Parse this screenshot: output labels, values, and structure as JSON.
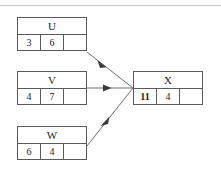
{
  "diagram": {
    "type": "dependency-flow",
    "top_rule_color": "#c9c9cc",
    "border_color": "#5a5a5e",
    "background_color": "#fefeff",
    "nodes": [
      {
        "id": "u",
        "name": "U",
        "cells": [
          "3",
          "6",
          ""
        ],
        "bold_cells": [
          false,
          false,
          false
        ]
      },
      {
        "id": "v",
        "name": "V",
        "cells": [
          "4",
          "7",
          ""
        ],
        "bold_cells": [
          false,
          false,
          false
        ]
      },
      {
        "id": "w",
        "name": "W",
        "cells": [
          "6",
          "4",
          ""
        ],
        "bold_cells": [
          false,
          false,
          false
        ]
      },
      {
        "id": "x",
        "name": "X",
        "cells": [
          "11",
          "4",
          ""
        ],
        "bold_cells": [
          true,
          false,
          false
        ]
      }
    ],
    "edges": [
      {
        "from": "U",
        "to": "X",
        "style": "solid-arrow"
      },
      {
        "from": "V",
        "to": "X",
        "style": "solid-arrow"
      },
      {
        "from": "W",
        "to": "X",
        "style": "solid-arrow"
      }
    ]
  }
}
